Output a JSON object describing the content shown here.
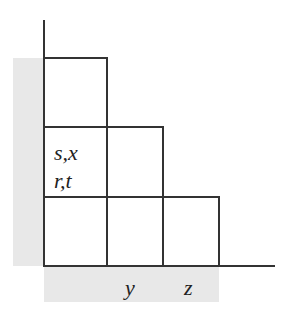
{
  "colors": {
    "line": "#333333",
    "band": "#e8e8e8",
    "text": "#222222"
  },
  "cells": [
    {
      "id": "cell-col1-row3",
      "labels": []
    },
    {
      "id": "cell-col1-row2",
      "labels": [
        "s,x",
        "r,t"
      ]
    },
    {
      "id": "cell-col1-row1",
      "labels": []
    },
    {
      "id": "cell-col2-row2",
      "labels": []
    },
    {
      "id": "cell-col2-row1",
      "labels": []
    },
    {
      "id": "cell-col3-row1",
      "labels": []
    }
  ],
  "labels": {
    "cell_upper": "s,x",
    "cell_lower": "r,t",
    "axis_y": "y",
    "axis_z": "z"
  }
}
